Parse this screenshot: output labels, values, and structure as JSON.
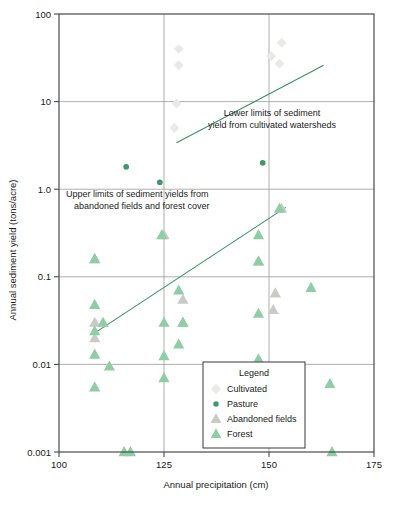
{
  "chart_data": {
    "type": "scatter",
    "title": "",
    "xlabel": "Annual precipitation (cm)",
    "ylabel": "Annual sediment yield (tons/acre)",
    "xlim": [
      100,
      175
    ],
    "ylim": [
      0.001,
      100
    ],
    "yscale": "log",
    "xscale": "linear",
    "xticks": [
      "100",
      "125",
      "150",
      "175"
    ],
    "xtick_values": [
      100,
      125,
      150,
      175
    ],
    "yticks": [
      "100",
      "10",
      "1.0",
      "0.1",
      "0.01",
      "0.001"
    ],
    "ytick_values": [
      100,
      10,
      1.0,
      0.1,
      0.01,
      0.001
    ],
    "grid": true,
    "legend_position": "lower-center",
    "legend_title": "Legend",
    "series": [
      {
        "name": "Cultivated",
        "marker": "diamond",
        "color": "#e8eae6",
        "points": [
          [
            128.5,
            40.0
          ],
          [
            128.5,
            26.0
          ],
          [
            128.0,
            9.5
          ],
          [
            127.5,
            5.0
          ],
          [
            153.0,
            47.0
          ],
          [
            152.5,
            27.0
          ],
          [
            150.5,
            33.0
          ]
        ]
      },
      {
        "name": "Pasture",
        "marker": "circle",
        "color": "#3c9a62",
        "points": [
          [
            116.0,
            1.8
          ],
          [
            124.0,
            1.2
          ],
          [
            148.5,
            2.0
          ]
        ]
      },
      {
        "name": "Abandoned fields",
        "marker": "triangle",
        "color": "#c9cbc6",
        "points": [
          [
            108.5,
            0.16
          ],
          [
            108.5,
            0.03
          ],
          [
            108.5,
            0.02
          ],
          [
            125.0,
            0.3
          ],
          [
            129.5,
            0.055
          ],
          [
            129.5,
            0.03
          ],
          [
            147.5,
            0.15
          ],
          [
            151.5,
            0.065
          ],
          [
            151.0,
            0.042
          ],
          [
            153.0,
            0.6
          ]
        ]
      },
      {
        "name": "Forest",
        "marker": "triangle",
        "color": "#8fcda4",
        "points": [
          [
            108.5,
            0.16
          ],
          [
            108.5,
            0.048
          ],
          [
            108.5,
            0.024
          ],
          [
            108.5,
            0.013
          ],
          [
            108.5,
            0.0055
          ],
          [
            110.5,
            0.03
          ],
          [
            112.0,
            0.0095
          ],
          [
            115.5,
            0.001
          ],
          [
            117.0,
            0.001
          ],
          [
            124.5,
            0.3
          ],
          [
            125.0,
            0.03
          ],
          [
            125.0,
            0.0125
          ],
          [
            125.0,
            0.007
          ],
          [
            128.5,
            0.07
          ],
          [
            129.5,
            0.03
          ],
          [
            128.5,
            0.017
          ],
          [
            147.5,
            0.3
          ],
          [
            147.5,
            0.15
          ],
          [
            147.5,
            0.038
          ],
          [
            147.5,
            0.0115
          ],
          [
            152.5,
            0.6
          ],
          [
            160.0,
            0.075
          ],
          [
            164.5,
            0.006
          ],
          [
            165.0,
            0.001
          ]
        ]
      }
    ],
    "annotations": [
      {
        "name": "upper-trend-annotation",
        "line1": "Lower limits of sediment",
        "line2": "yield from cultivated watersheds"
      },
      {
        "name": "lower-trend-annotation",
        "line1": "Upper limits of sediment yields from",
        "line2": "abandoned fields and forest cover"
      }
    ],
    "trend_lines": [
      {
        "name": "lower-limits-cultivated-line",
        "x1": 128.0,
        "y1": 3.4,
        "x2": 163.0,
        "y2": 26.0,
        "color": "#3c8f6b"
      },
      {
        "name": "upper-limits-abandoned-forest-line",
        "x1": 108.0,
        "y1": 0.022,
        "x2": 154.0,
        "y2": 0.62,
        "color": "#3c8f6b"
      }
    ],
    "colors": {
      "cultivated": "#e8eae6",
      "pasture": "#3c9a62",
      "abandoned_fields": "#c9cbc6",
      "forest": "#8fcda4",
      "trend_line": "#3c8f6b",
      "grid": "#9a9a9a",
      "axis": "#4a4a4a",
      "text": "#1a1a1a"
    }
  },
  "legend": {
    "title": "Legend",
    "items": [
      {
        "label": "Cultivated",
        "marker": "diamond",
        "color": "#e8eae6"
      },
      {
        "label": "Pasture",
        "marker": "circle",
        "color": "#3c9a62"
      },
      {
        "label": "Abandoned fields",
        "marker": "triangle",
        "color": "#c9cbc6"
      },
      {
        "label": "Forest",
        "marker": "triangle",
        "color": "#8fcda4"
      }
    ]
  }
}
